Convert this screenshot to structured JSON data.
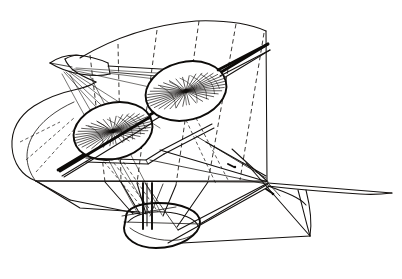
{
  "document": {
    "kind": "technical-line-drawing",
    "title": "Perspective line drawing of an early flying machine",
    "medium": "pen and ink line engraving",
    "visible_text": "",
    "background_color": "#ffffff",
    "ink_color": "#141110"
  },
  "figure": {
    "label": "flying-machine-perspective",
    "view": "three-quarter perspective from above and the left front",
    "line_styles": [
      "solid construction lines",
      "dashed projection lines"
    ],
    "parts": [
      {
        "id": "main-wing",
        "label": "curved main wing / lifting surface",
        "style": "solid outline with dashed rib lines"
      },
      {
        "id": "rotor-upper",
        "label": "upper rotary wing disc",
        "style": "ellipse with radial spokes"
      },
      {
        "id": "rotor-lower",
        "label": "lower rotary wing disc",
        "style": "ellipse with radial spokes"
      },
      {
        "id": "drive-shaft",
        "label": "inclined drive shaft through both rotor hubs",
        "style": "heavy solid double line"
      },
      {
        "id": "forward-mast",
        "label": "forward mast / bowsprit pylon",
        "style": "solid tapered spar"
      },
      {
        "id": "rigging",
        "label": "stay wires and bracing cables",
        "style": "fine solid lines"
      },
      {
        "id": "gondola",
        "label": "boat-shaped gondola / hull",
        "style": "solid closed curve"
      },
      {
        "id": "tail",
        "label": "pointed tail plane and rudder",
        "style": "solid lines"
      }
    ],
    "counts": {
      "rotors": 2,
      "upper_rotor_spokes": 34,
      "lower_rotor_spokes": 34,
      "wing_rib_dashed_lines": 6
    },
    "geometry": {
      "canvas": {
        "width": 402,
        "height": 279
      },
      "rotor_upper": {
        "cx": 186,
        "cy": 91,
        "rx": 41,
        "ry": 29,
        "rotation": -14
      },
      "rotor_lower": {
        "cx": 113,
        "cy": 131,
        "rx": 40,
        "ry": 28,
        "rotation": -14
      },
      "shaft": {
        "x1": 58,
        "y1": 168,
        "x2": 268,
        "y2": 42
      },
      "tail_tip": {
        "x": 392,
        "y": 193
      },
      "gondola_center": {
        "x": 158,
        "y": 232
      }
    }
  }
}
